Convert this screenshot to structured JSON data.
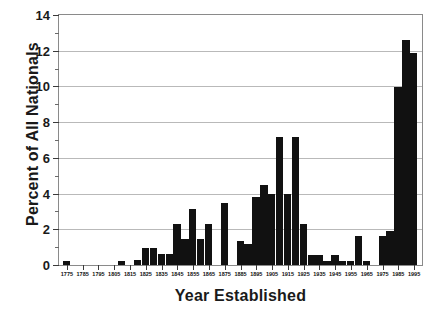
{
  "chart_data": {
    "type": "bar",
    "title": "",
    "xlabel": "Year Established",
    "ylabel": "Percent of All Nationals",
    "ylim": [
      0,
      14
    ],
    "xlim": [
      1770,
      2000
    ],
    "grid": true,
    "legend": null,
    "bar_color": "#111111",
    "y_ticks": [
      0,
      2,
      4,
      6,
      8,
      10,
      12,
      14
    ],
    "y_tick_labels": [
      "0",
      "2",
      "4",
      "6",
      "8",
      "10",
      "12",
      "14"
    ],
    "y_minor_ticks": [
      1,
      3,
      5,
      7,
      9,
      11,
      13
    ],
    "x_ticks": [
      1775,
      1785,
      1795,
      1805,
      1815,
      1825,
      1835,
      1845,
      1855,
      1865,
      1875,
      1885,
      1895,
      1905,
      1915,
      1925,
      1935,
      1945,
      1955,
      1965,
      1975,
      1985,
      1995
    ],
    "x_tick_labels": [
      "1775",
      "1785",
      "1795",
      "1805",
      "1815",
      "1825",
      "1835",
      "1845",
      "1855",
      "1865",
      "1875",
      "1885",
      "1895",
      "1905",
      "1915",
      "1925",
      "1935",
      "1945",
      "1955",
      "1965",
      "1975",
      "1985",
      "1995"
    ],
    "bin_width": 5,
    "categories": [
      1775,
      1780,
      1785,
      1790,
      1795,
      1800,
      1805,
      1810,
      1815,
      1820,
      1825,
      1830,
      1835,
      1840,
      1845,
      1850,
      1855,
      1860,
      1865,
      1870,
      1875,
      1880,
      1885,
      1890,
      1895,
      1900,
      1905,
      1910,
      1915,
      1920,
      1925,
      1930,
      1935,
      1940,
      1945,
      1950,
      1955,
      1960,
      1965,
      1970,
      1975,
      1980,
      1985,
      1990,
      1995
    ],
    "values": [
      0.25,
      0,
      0,
      0,
      0,
      0,
      0,
      0.25,
      0,
      0.3,
      0.95,
      0.95,
      0.6,
      0.6,
      2.3,
      1.45,
      3.15,
      1.45,
      2.3,
      0,
      3.45,
      0,
      1.35,
      1.2,
      3.8,
      4.5,
      3.95,
      7.15,
      3.95,
      7.15,
      2.3,
      0.55,
      0.55,
      0.25,
      0.55,
      0.25,
      0.25,
      1.65,
      0.25,
      0,
      1.6,
      1.9,
      9.95,
      12.6,
      11.85
    ]
  },
  "dimensions": {
    "width": 430,
    "height": 310
  }
}
